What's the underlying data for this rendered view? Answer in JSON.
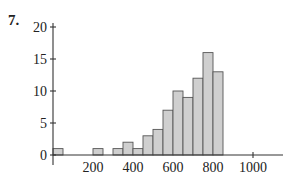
{
  "problem_number": "7.",
  "chart_data": {
    "type": "bar",
    "subtype": "histogram",
    "title": "",
    "xlabel": "",
    "ylabel": "",
    "bin_width": 50,
    "bins": [
      {
        "start": 0,
        "end": 50,
        "count": 1
      },
      {
        "start": 200,
        "end": 250,
        "count": 1
      },
      {
        "start": 300,
        "end": 350,
        "count": 1
      },
      {
        "start": 350,
        "end": 400,
        "count": 2
      },
      {
        "start": 400,
        "end": 450,
        "count": 1
      },
      {
        "start": 450,
        "end": 500,
        "count": 3
      },
      {
        "start": 500,
        "end": 550,
        "count": 4
      },
      {
        "start": 550,
        "end": 600,
        "count": 7
      },
      {
        "start": 600,
        "end": 650,
        "count": 10
      },
      {
        "start": 650,
        "end": 700,
        "count": 9
      },
      {
        "start": 700,
        "end": 750,
        "count": 12
      },
      {
        "start": 750,
        "end": 800,
        "count": 16
      },
      {
        "start": 800,
        "end": 850,
        "count": 13
      }
    ],
    "categories": [
      "0-50",
      "200-250",
      "300-350",
      "350-400",
      "400-450",
      "450-500",
      "500-550",
      "550-600",
      "600-650",
      "650-700",
      "700-750",
      "750-800",
      "800-850"
    ],
    "values": [
      1,
      1,
      1,
      2,
      1,
      3,
      4,
      7,
      10,
      9,
      12,
      16,
      13
    ],
    "xlim": [
      0,
      1100
    ],
    "ylim": [
      0,
      20
    ],
    "x_ticks": [
      200,
      400,
      600,
      800,
      1000
    ],
    "y_ticks": [
      0,
      5,
      10,
      15,
      20
    ],
    "grid": false,
    "legend": null,
    "bar_color": "#cfcfcf",
    "edge_color": "#555555"
  }
}
